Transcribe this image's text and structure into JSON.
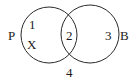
{
  "diagram": {
    "type": "venn",
    "sets": [
      {
        "name": "P",
        "label": "P"
      },
      {
        "name": "B",
        "label": "B"
      }
    ],
    "regions": {
      "p_only": "1",
      "p_only_marker": "X",
      "intersection": "2",
      "b_only": "3",
      "outside": "4"
    },
    "colors": {
      "stroke": "#2a2a2a",
      "text": "#1a1a1a",
      "background": "#ffffff"
    }
  }
}
